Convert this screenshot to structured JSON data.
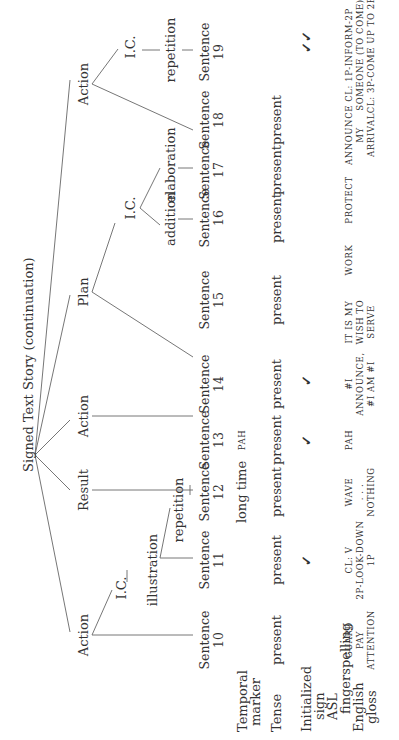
{
  "title": "Signed Text Story (continuation)",
  "row_labels": {
    "temporal_marker": "Temporal\nmarker",
    "temporal_marker_1": "Temporal",
    "temporal_marker_2": "marker",
    "tense": "Tense",
    "initialized_sign_1": "Initialized",
    "initialized_sign_2": "sign",
    "asl_fingerspelling_1": "ASL",
    "asl_fingerspelling_2": "fingerspelling",
    "english_gloss_1": "English",
    "english_gloss_2": "gloss"
  },
  "tree": {
    "root": "Signed Text Story (continuation)",
    "nodes": {
      "action_left": "Action",
      "ic_left": "I.C.",
      "illustration": "illustration",
      "repetition_left": "repetition",
      "result": "Result",
      "action_mid": "Action",
      "plan": "Plan",
      "ic_plan": "I.C.",
      "addition": "addition",
      "elaboration": "elaboration",
      "action_right": "Action",
      "ic_right": "I.C.",
      "repetition_right": "repetition"
    }
  },
  "sentences": [
    {
      "label": "Sentence",
      "num": "10",
      "temporal": "",
      "tense": "present",
      "initialized": "",
      "gloss": [
        "GUARD",
        "PAY",
        "ATTENTION"
      ]
    },
    {
      "label": "Sentence",
      "num": "11",
      "temporal": "",
      "tense": "present",
      "initialized": "✓",
      "gloss": [
        "CL: V",
        "2P-LOOK-DOWN",
        "1P"
      ]
    },
    {
      "label": "Sentence",
      "num": "12",
      "temporal": "long time",
      "tense": "present",
      "initialized": "",
      "gloss": [
        "WAVE",
        ". . .",
        "NOTHING"
      ]
    },
    {
      "label": "Sentence",
      "num": "13",
      "temporal": "PAH",
      "tense": "present",
      "initialized": "✓",
      "gloss": [
        "PAH",
        "",
        ""
      ]
    },
    {
      "label": "Sentence",
      "num": "14",
      "temporal": "",
      "tense": "present",
      "initialized": "✓",
      "gloss": [
        "#I",
        "ANNOUNCE,",
        "#I AM #I"
      ]
    },
    {
      "label": "Sentence",
      "num": "15",
      "temporal": "",
      "tense": "present",
      "initialized": "",
      "gloss": [
        "IT IS MY",
        "WISH TO",
        "SERVE"
      ]
    },
    {
      "label": "Sentence",
      "num": "16",
      "temporal": "",
      "tense": "present",
      "initialized": "",
      "gloss": [
        "WORK",
        "",
        ""
      ]
    },
    {
      "label": "Sentence",
      "num": "17",
      "temporal": "",
      "tense": "present",
      "initialized": "",
      "gloss": [
        "PROTECT",
        "",
        ""
      ]
    },
    {
      "label": "Sentence",
      "num": "18",
      "temporal": "",
      "tense": "present",
      "initialized": "",
      "gloss": [
        "ANNOUNCE",
        "MY",
        "ARRIVAL"
      ]
    },
    {
      "label": "Sentence",
      "num": "19",
      "temporal": "",
      "tense": "",
      "initialized": "✓✓",
      "gloss": [
        "CL: 1P-INFORM-2P",
        "SOMEONE (TO COME)",
        "CL: 3P-COME UP TO 2P"
      ]
    }
  ]
}
